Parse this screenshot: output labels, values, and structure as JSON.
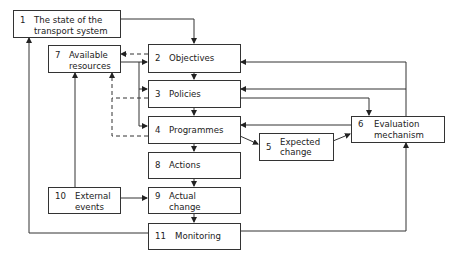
{
  "diagram": {
    "nodes": [
      {
        "id": "1",
        "number": "1",
        "label": "The state of the transport system"
      },
      {
        "id": "2",
        "number": "2",
        "label": "Objectives"
      },
      {
        "id": "3",
        "number": "3",
        "label": "Policies"
      },
      {
        "id": "4",
        "number": "4",
        "label": "Programmes"
      },
      {
        "id": "5",
        "number": "5",
        "label": "Expected change"
      },
      {
        "id": "6",
        "number": "6",
        "label": "Evaluation mechanism"
      },
      {
        "id": "7",
        "number": "7",
        "label": "Available resources"
      },
      {
        "id": "8",
        "number": "8",
        "label": "Actions"
      },
      {
        "id": "9",
        "number": "9",
        "label": "Actual change"
      },
      {
        "id": "10",
        "number": "10",
        "label": "External events"
      },
      {
        "id": "11",
        "number": "11",
        "label": "Monitoring"
      }
    ],
    "node_lines": {
      "n1": [
        "The state of the",
        "transport system"
      ],
      "n7": [
        "Available",
        "resources"
      ],
      "n5": [
        "Expected",
        "change"
      ],
      "n6": [
        "Evaluation",
        "mechanism"
      ],
      "n9": [
        "Actual",
        "change"
      ],
      "n10": [
        "External",
        "events"
      ]
    },
    "edges": [
      {
        "from": "1",
        "to": "2",
        "style": "solid"
      },
      {
        "from": "2",
        "to": "3",
        "style": "solid"
      },
      {
        "from": "3",
        "to": "4",
        "style": "solid"
      },
      {
        "from": "4",
        "to": "8",
        "style": "solid"
      },
      {
        "from": "8",
        "to": "9",
        "style": "solid"
      },
      {
        "from": "9",
        "to": "11",
        "style": "solid"
      },
      {
        "from": "2",
        "to": "7",
        "style": "dashed"
      },
      {
        "from": "3",
        "to": "7",
        "style": "dashed"
      },
      {
        "from": "4",
        "to": "7",
        "style": "dashed"
      },
      {
        "from": "7",
        "to": "2",
        "style": "solid"
      },
      {
        "from": "7",
        "to": "3",
        "style": "solid"
      },
      {
        "from": "7",
        "to": "4",
        "style": "solid"
      },
      {
        "from": "4",
        "to": "5",
        "style": "solid"
      },
      {
        "from": "5",
        "to": "6",
        "style": "solid"
      },
      {
        "from": "3",
        "to": "6",
        "style": "solid"
      },
      {
        "from": "6",
        "to": "2",
        "style": "solid"
      },
      {
        "from": "6",
        "to": "3",
        "style": "solid"
      },
      {
        "from": "6",
        "to": "4",
        "style": "solid"
      },
      {
        "from": "10",
        "to": "7",
        "style": "solid"
      },
      {
        "from": "10",
        "to": "9",
        "style": "solid"
      },
      {
        "from": "11",
        "to": "1",
        "style": "solid"
      },
      {
        "from": "11",
        "to": "6",
        "style": "solid"
      }
    ]
  }
}
